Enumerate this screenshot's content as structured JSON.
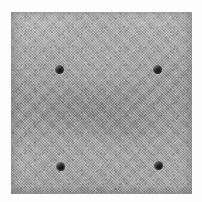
{
  "scene": {
    "title": "Concrete slab specimen with four drilled holes",
    "subject_label": "square grey cement slab",
    "background_color": "#fdfdfd",
    "view": "top-down / flat frontal"
  },
  "slab": {
    "name": "square grey concrete slab",
    "material": "cement / concrete with fine woven aggregate texture",
    "surface_finish": "matte mottled grain",
    "base_color": "#a3a3a3",
    "light_tone": "#b0b0b0",
    "mid_tone": "#9d9d9d",
    "dark_tone": "#8e8e8e",
    "edge_shadow_color": "#5a5a5a",
    "bounds": {
      "left": 11,
      "top": 12,
      "width": 181,
      "height": 182
    },
    "shape": "square"
  },
  "holes": {
    "count": 4,
    "arrangement": "rectangular grid, 2 by 2",
    "color": "#151515",
    "rim_highlight": "#ebebeb",
    "diameter_px": 9,
    "items": [
      {
        "id": "hole-top-left",
        "label": "top-left drill hole",
        "x": 44,
        "y": 53
      },
      {
        "id": "hole-top-right",
        "label": "top-right drill hole",
        "x": 142,
        "y": 53
      },
      {
        "id": "hole-bottom-left",
        "label": "bottom-left drill hole",
        "x": 45,
        "y": 150
      },
      {
        "id": "hole-bottom-right",
        "label": "bottom-right drill hole",
        "x": 143,
        "y": 149
      }
    ]
  }
}
